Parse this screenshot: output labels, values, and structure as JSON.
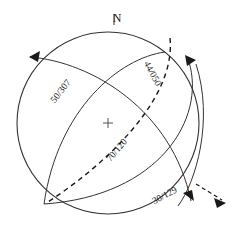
{
  "figure": {
    "background_color": "#ffffff",
    "line_color": "#333333",
    "text_color": "#1a1a1a"
  },
  "primitive_circle": {
    "name": "primitive-circle",
    "center_x": 108,
    "center_y": 123,
    "radius": 91
  },
  "north_marker": {
    "label": "N",
    "tick_label": ""
  },
  "center_marker": {
    "symbol": "+"
  },
  "planes": [
    {
      "id": "plane-50-307",
      "label": "50/307",
      "dip": 50,
      "dip_direction": 307,
      "style": "solid",
      "label_x": 63,
      "label_y": 93,
      "label_rotation": -52
    },
    {
      "id": "plane-44-050",
      "label": "44/050",
      "dip": 44,
      "dip_direction": 50,
      "style": "solid",
      "label_x": 150,
      "label_y": 75,
      "label_rotation": 62
    },
    {
      "id": "plane-30-129",
      "label": "30/129",
      "dip": 30,
      "dip_direction": 129,
      "style": "solid",
      "label_x": 166,
      "label_y": 198,
      "label_rotation": -28
    },
    {
      "id": "plane-70-120",
      "label": "70/120",
      "dip": 70,
      "dip_direction": 120,
      "style": "dashed",
      "label_x": 119,
      "label_y": 152,
      "label_rotation": -50
    }
  ],
  "arrows": [
    {
      "id": "arrow-dip-left",
      "style": "solid",
      "description": "dip arrow upper left"
    },
    {
      "id": "arrow-dip-right",
      "style": "solid",
      "description": "dip arrow upper right"
    },
    {
      "id": "arrow-dip-lower-right",
      "style": "solid",
      "description": "dip arrow lower right"
    },
    {
      "id": "arrow-dashed-outward",
      "style": "dashed",
      "description": "dashed outward arrow lower right"
    }
  ]
}
